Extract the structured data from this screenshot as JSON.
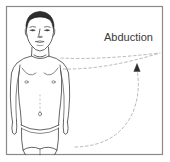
{
  "figure": {
    "title_label": "Abduction",
    "border_color": "#8a8a8a",
    "background_color": "#ffffff",
    "outline_color": "#4a4a4a",
    "motion_path_color": "#b0b0b0",
    "hair_color": "#2e2e2e",
    "label_color": "#3a3a3a",
    "arrowhead_color": "#2b2b2b",
    "subject_description": "anterior view of a standing male figure wearing briefs, arms at sides",
    "motion": {
      "name": "Abduction",
      "plane": "frontal",
      "joint": "shoulder",
      "start_position": "arm at side",
      "end_position": "arm raised overhead",
      "arrow_direction": "upward"
    }
  }
}
